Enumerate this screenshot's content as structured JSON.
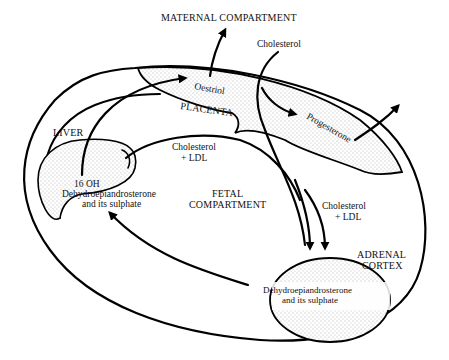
{
  "diagram": {
    "type": "feto-placental steroid pathway",
    "colors": {
      "line": "#000000",
      "background": "#ffffff",
      "stipple": "#555555"
    },
    "compartments": {
      "maternal": "MATERNAL COMPARTMENT",
      "fetal_line1": "FETAL",
      "fetal_line2": "COMPARTMENT",
      "placenta": "PLACENTA",
      "liver": "LIVER",
      "adrenal_line1": "ADRENAL",
      "adrenal_line2": "CORTEX"
    },
    "substances": {
      "oestriol": "Oestriol",
      "progesterone": "Progesterone",
      "cholesterol_maternal": "Cholesterol",
      "cholesterol_ldl_left_line1": "Cholesterol",
      "cholesterol_ldl_left_line2": "+ LDL",
      "cholesterol_ldl_right_line1": "Cholesterol",
      "cholesterol_ldl_right_line2": "+ LDL",
      "liver_product_line1": "16 OH",
      "liver_product_line2": "Dehydroepiandrosterone",
      "liver_product_line3": "and its sulphate",
      "adrenal_product_line1": "Dehydroepiandrosterone",
      "adrenal_product_line2": "and its sulphate"
    },
    "flows": [
      {
        "from": "Liver (16 OH DHEA)",
        "to": "Oestriol (placenta)"
      },
      {
        "from": "Oestriol",
        "to": "Maternal compartment"
      },
      {
        "from": "Maternal Cholesterol",
        "to": "Progesterone (placenta)"
      },
      {
        "from": "Progesterone",
        "to": "Maternal compartment"
      },
      {
        "from": "Cholesterol + LDL",
        "to": "Liver"
      },
      {
        "from": "Cholesterol + LDL",
        "to": "Adrenal cortex"
      },
      {
        "from": "Adrenal DHEA and its sulphate",
        "to": "Liver"
      }
    ]
  }
}
